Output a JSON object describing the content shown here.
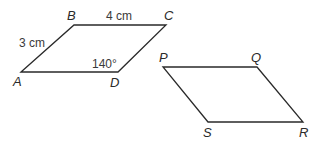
{
  "figure": {
    "parallelogram_abcd": {
      "vertices": {
        "A": "A",
        "B": "B",
        "C": "C",
        "D": "D"
      },
      "side_ab": "3 cm",
      "side_bc": "4 cm",
      "angle_d": "140°"
    },
    "parallelogram_pqrs": {
      "vertices": {
        "P": "P",
        "Q": "Q",
        "R": "R",
        "S": "S"
      }
    }
  }
}
